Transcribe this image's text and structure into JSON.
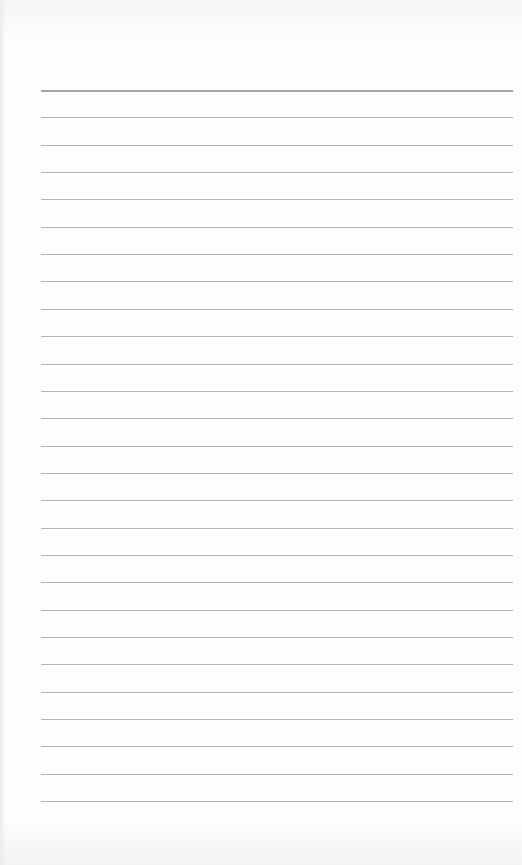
{
  "document": {
    "type": "ruled-paper",
    "title": "",
    "body_text": "",
    "rule_count": 27,
    "rule_spacing_px": 27.35,
    "first_rule_y": 90,
    "rule_left_x": 41,
    "rule_right_x": 513,
    "colors": {
      "paper": "#fdfdfd",
      "rule": "#9a9a9a"
    }
  }
}
